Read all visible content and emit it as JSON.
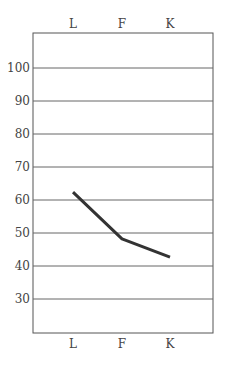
{
  "chart_data": {
    "type": "line",
    "title": "",
    "xlabel": "",
    "ylabel": "",
    "categories": [
      "L",
      "F",
      "K"
    ],
    "values": [
      62.4,
      48.2,
      42.7
    ],
    "y_ticks": [
      30,
      40,
      50,
      60,
      70,
      80,
      90,
      100
    ],
    "ylim": [
      20,
      110
    ],
    "grid": true,
    "legend": null,
    "line_color": "#333333"
  }
}
